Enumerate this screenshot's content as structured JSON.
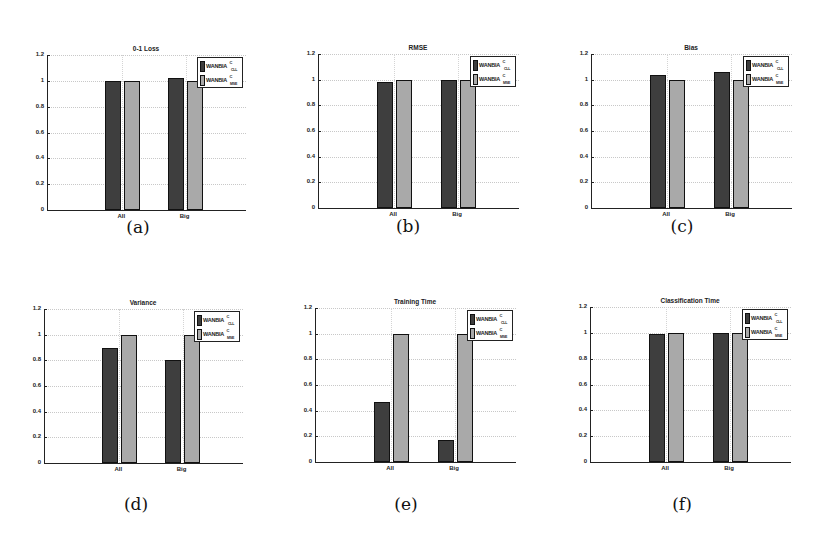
{
  "legend": {
    "series1": {
      "name": "WANBIA",
      "sup": "C",
      "sub": "CLL"
    },
    "series2": {
      "name": "WANBIA",
      "sup": "C",
      "sub": "MSE"
    }
  },
  "colors": {
    "series1": "#3e3e3e",
    "series2": "#a9a9a9"
  },
  "ticks": [
    "0",
    "0.2",
    "0.4",
    "0.6",
    "0.8",
    "1",
    "1.2"
  ],
  "categories": [
    "All",
    "Big"
  ],
  "panels": [
    {
      "title": "0-1 Loss",
      "caption": "(a)"
    },
    {
      "title": "RMSE",
      "caption": "(b)"
    },
    {
      "title": "Bias",
      "caption": "(c)"
    },
    {
      "title": "Variance",
      "caption": "(d)"
    },
    {
      "title": "Training Time",
      "caption": "(e)"
    },
    {
      "title": "Classification Time",
      "caption": "(f)"
    }
  ],
  "chart_data": [
    {
      "type": "bar",
      "title": "0-1 Loss",
      "categories": [
        "All",
        "Big"
      ],
      "series": [
        {
          "name": "WANBIA^C_CLL",
          "values": [
            1.0,
            1.02
          ]
        },
        {
          "name": "WANBIA^C_MSE",
          "values": [
            1.0,
            1.0
          ]
        }
      ],
      "ylim": [
        0,
        1.2
      ],
      "yticks": [
        0,
        0.2,
        0.4,
        0.6,
        0.8,
        1,
        1.2
      ],
      "grid": true,
      "legend_position": "upper right",
      "caption": "(a)"
    },
    {
      "type": "bar",
      "title": "RMSE",
      "categories": [
        "All",
        "Big"
      ],
      "series": [
        {
          "name": "WANBIA^C_CLL",
          "values": [
            0.98,
            1.0
          ]
        },
        {
          "name": "WANBIA^C_MSE",
          "values": [
            1.0,
            1.0
          ]
        }
      ],
      "ylim": [
        0,
        1.2
      ],
      "yticks": [
        0,
        0.2,
        0.4,
        0.6,
        0.8,
        1,
        1.2
      ],
      "grid": true,
      "legend_position": "upper right",
      "caption": "(b)"
    },
    {
      "type": "bar",
      "title": "Bias",
      "categories": [
        "All",
        "Big"
      ],
      "series": [
        {
          "name": "WANBIA^C_CLL",
          "values": [
            1.04,
            1.06
          ]
        },
        {
          "name": "WANBIA^C_MSE",
          "values": [
            1.0,
            1.0
          ]
        }
      ],
      "ylim": [
        0,
        1.2
      ],
      "yticks": [
        0,
        0.2,
        0.4,
        0.6,
        0.8,
        1,
        1.2
      ],
      "grid": true,
      "legend_position": "upper right",
      "caption": "(c)"
    },
    {
      "type": "bar",
      "title": "Variance",
      "categories": [
        "All",
        "Big"
      ],
      "series": [
        {
          "name": "WANBIA^C_CLL",
          "values": [
            0.9,
            0.8
          ]
        },
        {
          "name": "WANBIA^C_MSE",
          "values": [
            1.0,
            1.0
          ]
        }
      ],
      "ylim": [
        0,
        1.2
      ],
      "yticks": [
        0,
        0.2,
        0.4,
        0.6,
        0.8,
        1,
        1.2
      ],
      "grid": true,
      "legend_position": "upper right",
      "caption": "(d)"
    },
    {
      "type": "bar",
      "title": "Training Time",
      "categories": [
        "All",
        "Big"
      ],
      "series": [
        {
          "name": "WANBIA^C_CLL",
          "values": [
            0.47,
            0.17
          ]
        },
        {
          "name": "WANBIA^C_MSE",
          "values": [
            1.0,
            1.0
          ]
        }
      ],
      "ylim": [
        0,
        1.2
      ],
      "yticks": [
        0,
        0.2,
        0.4,
        0.6,
        0.8,
        1,
        1.2
      ],
      "grid": true,
      "legend_position": "upper right",
      "caption": "(e)"
    },
    {
      "type": "bar",
      "title": "Classification Time",
      "categories": [
        "All",
        "Big"
      ],
      "series": [
        {
          "name": "WANBIA^C_CLL",
          "values": [
            0.99,
            1.0
          ]
        },
        {
          "name": "WANBIA^C_MSE",
          "values": [
            1.0,
            1.0
          ]
        }
      ],
      "ylim": [
        0,
        1.2
      ],
      "yticks": [
        0,
        0.2,
        0.4,
        0.6,
        0.8,
        1,
        1.2
      ],
      "grid": true,
      "legend_position": "upper right",
      "caption": "(f)"
    }
  ]
}
